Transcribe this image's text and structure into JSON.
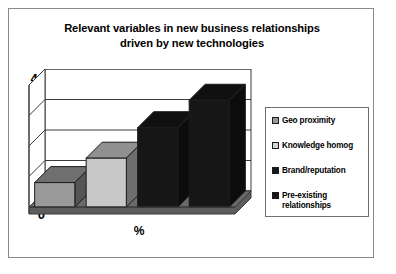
{
  "chart_data": {
    "type": "bar",
    "title": "Relevant variables in new business relationships driven by new technologies",
    "title_line1": "Relevant variables in new business relationships",
    "title_line2": "driven by new technologies",
    "xlabel": "%",
    "ylabel": "",
    "ylim": [
      0,
      40
    ],
    "yticks": [
      0,
      10,
      20,
      30,
      40
    ],
    "grid": true,
    "legend_position": "right",
    "style": "3d-column",
    "categories": [
      "Geo proximity",
      "Knowledge homog",
      "Brand/reputation",
      "Pre-existing relationships"
    ],
    "values": [
      8,
      16,
      26,
      35
    ],
    "colors": [
      "#9a9a9a",
      "#c8c8c8",
      "#161616",
      "#161616"
    ]
  },
  "legend": {
    "items": [
      {
        "label": "Geo proximity",
        "color": "#9a9a9a"
      },
      {
        "label": "Knowledge homog",
        "color": "#d4d4d4"
      },
      {
        "label": "Brand/reputation",
        "color": "#161616"
      },
      {
        "label": "Pre-existing\nrelationships",
        "color": "#161616"
      }
    ]
  },
  "axis": {
    "y_labels": [
      "40",
      "30",
      "20",
      "10",
      "0"
    ],
    "x_label": "%"
  }
}
